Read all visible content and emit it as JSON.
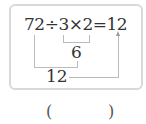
{
  "problem": {
    "expression": "72÷3×2=12",
    "intermediate_1": "6",
    "intermediate_2": "12",
    "answer_open": "(",
    "answer_close": ")"
  }
}
